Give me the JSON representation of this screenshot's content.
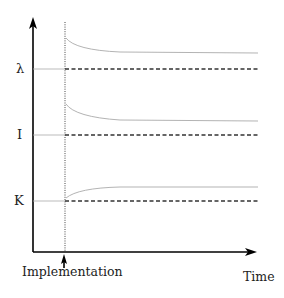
{
  "diagram": {
    "y_labels": {
      "lambda": "λ",
      "I": "I",
      "K": "K"
    },
    "x_label": "Time",
    "event_label": "Implementation",
    "series": [
      {
        "name": "λ",
        "baseline_y": 69,
        "curve": "decaying",
        "start_y": 36,
        "end_y": 53
      },
      {
        "name": "I",
        "baseline_y": 135,
        "curve": "decaying",
        "start_y": 104,
        "end_y": 121
      },
      {
        "name": "K",
        "baseline_y": 201,
        "curve": "rising",
        "start_y": 199,
        "end_y": 187
      }
    ],
    "colors": {
      "axis": "#000000",
      "curve": "#aaaaaa",
      "dashed": "#333333"
    }
  }
}
